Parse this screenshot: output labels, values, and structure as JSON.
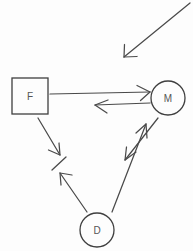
{
  "diagram": {
    "type": "node-link-diagram",
    "style": "hand-drawn-sketch",
    "background_color": "#fdfdfd",
    "stroke_color": "#4a4a4a",
    "label_color": "#555555",
    "nodes": [
      {
        "id": "F",
        "label": "F",
        "shape": "square",
        "x": 30,
        "y": 96,
        "width": 36,
        "height": 36
      },
      {
        "id": "M",
        "label": "M",
        "shape": "circle",
        "x": 168,
        "y": 98,
        "radius": 17
      },
      {
        "id": "D",
        "label": "D",
        "shape": "circle",
        "x": 97,
        "y": 230,
        "radius": 17
      }
    ],
    "edges": [
      {
        "id": "external-to-m",
        "from": "external",
        "to": "M",
        "arrowhead": "end",
        "x1": 190,
        "y1": 3,
        "x2": 124,
        "y2": 57
      },
      {
        "id": "f-to-m",
        "from": "F",
        "to": "M",
        "arrowhead": "end",
        "x1": 50,
        "y1": 94,
        "x2": 150,
        "y2": 92
      },
      {
        "id": "m-to-f",
        "from": "M",
        "to": "F",
        "arrowhead": "end",
        "x1": 150,
        "y1": 103,
        "x2": 95,
        "y2": 105
      },
      {
        "id": "m-to-junction",
        "from": "M",
        "to": "junction",
        "arrowhead": "end",
        "x1": 158,
        "y1": 118,
        "x2": 125,
        "y2": 160
      },
      {
        "id": "d-to-m",
        "from": "D",
        "to": "M",
        "arrowhead": "end",
        "x1": 112,
        "y1": 212,
        "x2": 146,
        "y2": 124
      },
      {
        "id": "f-to-junction",
        "from": "F",
        "to": "junction",
        "arrowhead": "end",
        "x1": 38,
        "y1": 118,
        "x2": 60,
        "y2": 155
      },
      {
        "id": "d-to-junction",
        "from": "D",
        "to": "junction",
        "arrowhead": "end",
        "x1": 87,
        "y1": 212,
        "x2": 60,
        "y2": 173
      }
    ],
    "markers": [
      {
        "id": "junction-tick",
        "type": "tick",
        "x1": 52,
        "y1": 170,
        "x2": 66,
        "y2": 157
      }
    ]
  }
}
